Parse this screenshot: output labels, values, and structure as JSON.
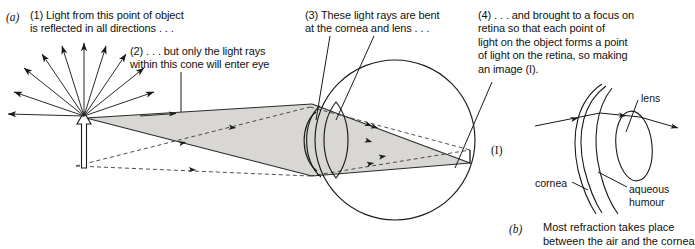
{
  "figure": {
    "panel_a": {
      "letter": "(a)",
      "callouts": [
        {
          "id": "callout-1",
          "number": "(1)",
          "text": "(1) Light from this point of object\nis reflected in all directions . . ."
        },
        {
          "id": "callout-2",
          "number": "(2)",
          "text": "(2) . . . but only the light rays\nwithin this cone will enter eye"
        },
        {
          "id": "callout-3",
          "number": "(3)",
          "text": "(3) These light rays are bent\nat the cornea and lens . . ."
        },
        {
          "id": "callout-4",
          "number": "(4)",
          "text": "(4) . . . and brought to a focus on\nretina so that each point of\nlight on the object forms a point\nof light on the retina, so making\nan image (I)."
        }
      ],
      "image_label": "(I)"
    },
    "panel_b": {
      "letter": "(b)",
      "caption": "Most refraction takes place\nbetween the air and the cornea",
      "labels": {
        "lens": "lens",
        "cornea": "cornea",
        "aqueous_humour": "aqueous\nhumour"
      }
    },
    "colors": {
      "ink": "#111111",
      "cone_fill": "#d9d7d3",
      "cone_stroke": "#2b2b2b",
      "paper": "#ffffff"
    }
  }
}
